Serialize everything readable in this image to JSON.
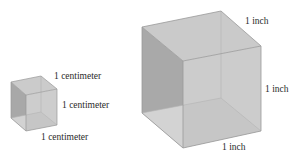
{
  "diagram": {
    "small_cube": {
      "name": "one cubic centimeter",
      "labels": {
        "top": "1 centimeter",
        "right": "1 centimeter",
        "bottom": "1 centimeter"
      }
    },
    "large_cube": {
      "name": "one cubic inch",
      "labels": {
        "top": "1 inch",
        "right": "1 inch",
        "bottom": "1 inch"
      }
    },
    "colors": {
      "face_top": "#c9c9c9",
      "face_left": "#a9a9a9",
      "face_front": "#c2c2c2",
      "face_bottom": "#d4d4d4",
      "edge": "#9a9a9a",
      "hidden_edge": "#b5b5b5"
    }
  }
}
